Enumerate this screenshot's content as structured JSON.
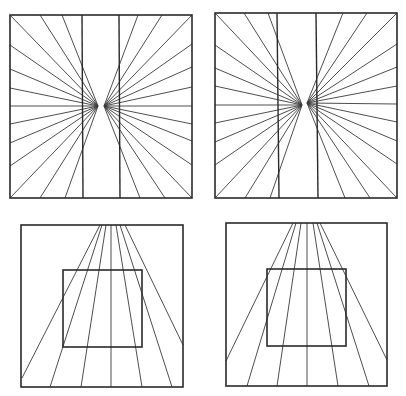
{
  "diagram": {
    "type": "optical-illusion-figures",
    "colors": {
      "background": "#ffffff",
      "line": "#2a2a2a",
      "ray": "#3a3a3a"
    },
    "panels": [
      {
        "id": "top-left",
        "kind": "radiating-lines-with-vertical-bars",
        "frame": {
          "x": 10,
          "y": 15,
          "w": 182,
          "h": 183
        },
        "bars": [
          {
            "x1": 82,
            "y1": 15,
            "x2": 83,
            "y2": 198
          },
          {
            "x1": 119,
            "y1": 15,
            "x2": 120,
            "y2": 198
          }
        ],
        "left_focus": [
          98,
          106
        ],
        "right_focus": [
          104,
          106
        ],
        "left_rays": [
          [
            10,
            15
          ],
          [
            40,
            15
          ],
          [
            62,
            15
          ],
          [
            10,
            45
          ],
          [
            10,
            69
          ],
          [
            10,
            88
          ],
          [
            10,
            106
          ],
          [
            10,
            124
          ],
          [
            10,
            143
          ],
          [
            10,
            166
          ],
          [
            10,
            198
          ],
          [
            40,
            198
          ],
          [
            65,
            198
          ]
        ],
        "right_rays": [
          [
            138,
            15
          ],
          [
            162,
            15
          ],
          [
            192,
            15
          ],
          [
            192,
            44
          ],
          [
            192,
            67
          ],
          [
            192,
            87
          ],
          [
            192,
            106
          ],
          [
            192,
            124
          ],
          [
            192,
            141
          ],
          [
            192,
            165
          ],
          [
            192,
            198
          ],
          [
            140,
            198
          ],
          [
            165,
            198
          ]
        ]
      },
      {
        "id": "top-right",
        "kind": "radiating-lines-with-vertical-bars",
        "frame": {
          "x": 215,
          "y": 13,
          "w": 182,
          "h": 185
        },
        "bars": [
          {
            "x1": 277,
            "y1": 13,
            "x2": 279,
            "y2": 198
          },
          {
            "x1": 316,
            "y1": 13,
            "x2": 318,
            "y2": 198
          }
        ],
        "left_focus": [
          302,
          105
        ],
        "right_focus": [
          307,
          103
        ],
        "left_rays": [
          [
            215,
            13
          ],
          [
            244,
            13
          ],
          [
            268,
            13
          ],
          [
            215,
            45
          ],
          [
            215,
            68
          ],
          [
            215,
            86
          ],
          [
            215,
            105
          ],
          [
            215,
            123
          ],
          [
            215,
            142
          ],
          [
            215,
            165
          ],
          [
            215,
            198
          ],
          [
            245,
            198
          ],
          [
            270,
            198
          ]
        ],
        "right_rays": [
          [
            343,
            13
          ],
          [
            367,
            13
          ],
          [
            397,
            13
          ],
          [
            397,
            44
          ],
          [
            397,
            67
          ],
          [
            397,
            86
          ],
          [
            397,
            104
          ],
          [
            397,
            122
          ],
          [
            397,
            141
          ],
          [
            397,
            164
          ],
          [
            397,
            198
          ],
          [
            345,
            198
          ],
          [
            370,
            198
          ]
        ]
      },
      {
        "id": "bottom-left",
        "kind": "converging-lines-with-square",
        "frame": {
          "x": 21,
          "y": 225,
          "w": 162,
          "h": 162
        },
        "inner_square": {
          "x": 63,
          "y": 270,
          "w": 79,
          "h": 77
        },
        "rays": [
          [
            [
              100,
              225
            ],
            [
              22,
              378
            ]
          ],
          [
            [
              102,
              225
            ],
            [
              50,
              387
            ]
          ],
          [
            [
              106,
              225
            ],
            [
              81,
              387
            ]
          ],
          [
            [
              111,
              225
            ],
            [
              111,
              387
            ]
          ],
          [
            [
              116,
              225
            ],
            [
              142,
              387
            ]
          ],
          [
            [
              120,
              225
            ],
            [
              172,
              387
            ]
          ],
          [
            [
              125,
              225
            ],
            [
              183,
              345
            ]
          ]
        ]
      },
      {
        "id": "bottom-right",
        "kind": "converging-lines-with-square",
        "frame": {
          "x": 226,
          "y": 223,
          "w": 161,
          "h": 163
        },
        "inner_square": {
          "x": 267,
          "y": 269,
          "w": 79,
          "h": 77
        },
        "rays": [
          [
            [
              293,
              223
            ],
            [
              226,
              361
            ]
          ],
          [
            [
              296,
              223
            ],
            [
              247,
              386
            ]
          ],
          [
            [
              301,
              223
            ],
            [
              277,
              386
            ]
          ],
          [
            [
              307,
              223
            ],
            [
              307,
              386
            ]
          ],
          [
            [
              313,
              223
            ],
            [
              338,
              386
            ]
          ],
          [
            [
              317,
              223
            ],
            [
              369,
              386
            ]
          ],
          [
            [
              320,
              223
            ],
            [
              387,
              360
            ]
          ]
        ]
      }
    ]
  }
}
